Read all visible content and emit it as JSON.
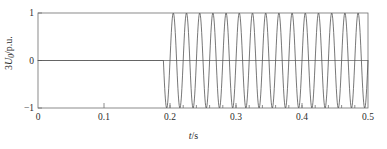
{
  "chart_data": {
    "type": "line",
    "title": "",
    "xlabel": "t/s",
    "ylabel": "3U0/p.u.",
    "ylabel_parts": {
      "prefix": "3",
      "symbol": "U",
      "subscript": "0",
      "unit": "/p.u."
    },
    "xlabel_parts": {
      "symbol": "t",
      "unit": "/s"
    },
    "xlim": [
      0,
      0.5
    ],
    "ylim": [
      -1,
      1
    ],
    "xticks": [
      0,
      0.1,
      0.2,
      0.3,
      0.4,
      0.5
    ],
    "xtick_labels": [
      "0",
      "0.1",
      "0.2",
      "0.3",
      "0.4",
      "0.5"
    ],
    "yticks": [
      1,
      0,
      -1
    ],
    "ytick_labels": [
      "1",
      "0",
      "-1"
    ],
    "grid": false,
    "legend": "none",
    "line_color": "#4a4a4a",
    "axis_color": "#6e6e6e",
    "background": "#ffffff",
    "series": [
      {
        "name": "3U0",
        "description": "Zero-sequence voltage: zero before fault, sinusoidal oscillation after fault inception",
        "fault_time": 0.19,
        "pre_fault_value": 0,
        "amplitude": 1.0,
        "frequency_hz": 50,
        "phase_deg": 180,
        "sample_step": 0.0005,
        "x_start": 0,
        "x_end": 0.5
      }
    ],
    "annotations": {
      "fault_inception_s": 0.19,
      "steady_amplitude_pu": 1.0,
      "cycles_after_fault": 15.5
    }
  },
  "figure": {
    "width": 387,
    "height": 149,
    "plot_left": 38,
    "plot_right": 368,
    "plot_top": 13,
    "plot_bottom": 108
  }
}
